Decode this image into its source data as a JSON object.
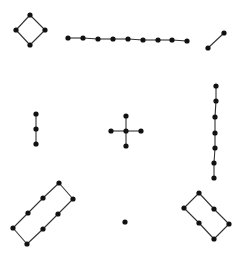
{
  "diagram": {
    "title": "",
    "colors": {
      "node": "#111111",
      "edge": "#333333",
      "background": "#ffffff"
    },
    "node_radius": 2.6,
    "components": [
      {
        "name": "cycle-4-diamond",
        "nodes": [
          [
            30,
            15
          ],
          [
            45,
            30
          ],
          [
            30,
            45
          ],
          [
            16,
            30
          ]
        ],
        "edges": [
          [
            0,
            1
          ],
          [
            1,
            2
          ],
          [
            2,
            3
          ],
          [
            3,
            0
          ]
        ]
      },
      {
        "name": "path-9-horizontal",
        "nodes": [
          [
            68,
            38
          ],
          [
            83,
            38
          ],
          [
            98,
            39
          ],
          [
            113,
            39
          ],
          [
            128,
            39
          ],
          [
            143,
            40
          ],
          [
            158,
            40
          ],
          [
            172,
            40
          ],
          [
            187,
            41
          ]
        ],
        "edges": [
          [
            0,
            1
          ],
          [
            1,
            2
          ],
          [
            2,
            3
          ],
          [
            3,
            4
          ],
          [
            4,
            5
          ],
          [
            5,
            6
          ],
          [
            6,
            7
          ],
          [
            7,
            8
          ]
        ]
      },
      {
        "name": "path-2-edge",
        "nodes": [
          [
            208,
            48
          ],
          [
            224,
            33
          ]
        ],
        "edges": [
          [
            0,
            1
          ]
        ]
      },
      {
        "name": "path-3-vertical",
        "nodes": [
          [
            36,
            114
          ],
          [
            36,
            129
          ],
          [
            36,
            144
          ]
        ],
        "edges": [
          [
            0,
            1
          ],
          [
            1,
            2
          ]
        ]
      },
      {
        "name": "star-5",
        "nodes": [
          [
            126,
            131
          ],
          [
            126,
            116
          ],
          [
            141,
            131
          ],
          [
            126,
            146
          ],
          [
            111,
            131
          ]
        ],
        "edges": [
          [
            0,
            1
          ],
          [
            0,
            2
          ],
          [
            0,
            3
          ],
          [
            0,
            4
          ]
        ]
      },
      {
        "name": "path-7-vertical",
        "nodes": [
          [
            216,
            86
          ],
          [
            216,
            101
          ],
          [
            215,
            117
          ],
          [
            215,
            133
          ],
          [
            215,
            148
          ],
          [
            214,
            163
          ],
          [
            214,
            178
          ]
        ],
        "edges": [
          [
            0,
            1
          ],
          [
            1,
            2
          ],
          [
            2,
            3
          ],
          [
            3,
            4
          ],
          [
            4,
            5
          ],
          [
            5,
            6
          ]
        ]
      },
      {
        "name": "cycle-8-rectangle",
        "nodes": [
          [
            59,
            183
          ],
          [
            73,
            199
          ],
          [
            58,
            214
          ],
          [
            43,
            229
          ],
          [
            27,
            244
          ],
          [
            13,
            228
          ],
          [
            28,
            213
          ],
          [
            43,
            198
          ]
        ],
        "edges": [
          [
            0,
            1
          ],
          [
            1,
            2
          ],
          [
            2,
            3
          ],
          [
            3,
            4
          ],
          [
            4,
            5
          ],
          [
            5,
            6
          ],
          [
            6,
            7
          ],
          [
            7,
            0
          ]
        ]
      },
      {
        "name": "isolated-vertex",
        "nodes": [
          [
            125,
            222
          ]
        ],
        "edges": []
      },
      {
        "name": "cycle-6-rectangle",
        "nodes": [
          [
            199,
            193
          ],
          [
            214,
            209
          ],
          [
            229,
            224
          ],
          [
            214,
            239
          ],
          [
            199,
            223
          ],
          [
            184,
            208
          ]
        ],
        "edges": [
          [
            0,
            1
          ],
          [
            1,
            2
          ],
          [
            2,
            3
          ],
          [
            3,
            4
          ],
          [
            4,
            5
          ],
          [
            5,
            0
          ]
        ]
      }
    ]
  }
}
